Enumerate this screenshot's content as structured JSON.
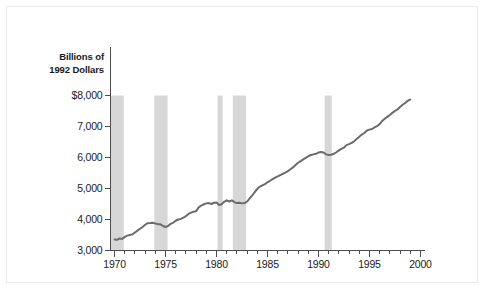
{
  "chart_data": {
    "type": "line",
    "title": "Billions of 1992 Dollars",
    "title_lines": [
      "Billions of",
      "1992 Dollars"
    ],
    "xlabel": "",
    "ylabel": "Billions of 1992 Dollars",
    "xlim": [
      1969.6,
      2000.4
    ],
    "ylim": [
      3000,
      8000
    ],
    "grid": false,
    "legend": null,
    "y_ticks": [
      3000,
      4000,
      5000,
      6000,
      7000,
      8000
    ],
    "y_tick_labels": [
      "3,000",
      "4,000",
      "5,000",
      "6,000",
      "7,000",
      "$8,000"
    ],
    "y_tick_labels_ordered_top_down": [
      "$8,000",
      "$7,000",
      "6,000",
      "5,000",
      "4,000",
      "3,000"
    ],
    "x_ticks": [
      1970,
      1975,
      1980,
      1985,
      1990,
      1995,
      2000
    ],
    "x_tick_labels": [
      "1970",
      "1975",
      "1980",
      "1985",
      "1990",
      "1995",
      "2000"
    ],
    "x_minor_tick_interval": 1,
    "line_color": "#6b6b6b",
    "line_width": 2,
    "band_color": "#d7d7d7",
    "axis_color": "#4d4d4d",
    "recession_bands": [
      {
        "start": 1969.6,
        "end": 1970.9
      },
      {
        "start": 1973.9,
        "end": 1975.2
      },
      {
        "start": 1980.1,
        "end": 1980.6
      },
      {
        "start": 1981.6,
        "end": 1982.9
      },
      {
        "start": 1990.6,
        "end": 1991.3
      }
    ],
    "series": [
      {
        "name": "Real GDP",
        "x": [
          1970.0,
          1970.25,
          1970.5,
          1970.75,
          1971.0,
          1971.25,
          1971.5,
          1971.75,
          1972.0,
          1972.25,
          1972.5,
          1972.75,
          1973.0,
          1973.25,
          1973.5,
          1973.75,
          1974.0,
          1974.25,
          1974.5,
          1974.75,
          1975.0,
          1975.25,
          1975.5,
          1975.75,
          1976.0,
          1976.25,
          1976.5,
          1976.75,
          1977.0,
          1977.25,
          1977.5,
          1977.75,
          1978.0,
          1978.25,
          1978.5,
          1978.75,
          1979.0,
          1979.25,
          1979.5,
          1979.75,
          1980.0,
          1980.25,
          1980.5,
          1980.75,
          1981.0,
          1981.25,
          1981.5,
          1981.75,
          1982.0,
          1982.25,
          1982.5,
          1982.75,
          1983.0,
          1983.25,
          1983.5,
          1983.75,
          1984.0,
          1984.25,
          1984.5,
          1984.75,
          1985.0,
          1985.25,
          1985.5,
          1985.75,
          1986.0,
          1986.25,
          1986.5,
          1986.75,
          1987.0,
          1987.25,
          1987.5,
          1987.75,
          1988.0,
          1988.25,
          1988.5,
          1988.75,
          1989.0,
          1989.25,
          1989.5,
          1989.75,
          1990.0,
          1990.25,
          1990.5,
          1990.75,
          1991.0,
          1991.25,
          1991.5,
          1991.75,
          1992.0,
          1992.25,
          1992.5,
          1992.75,
          1993.0,
          1993.25,
          1993.5,
          1993.75,
          1994.0,
          1994.25,
          1994.5,
          1994.75,
          1995.0,
          1995.25,
          1995.5,
          1995.75,
          1996.0,
          1996.25,
          1996.5,
          1996.75,
          1997.0,
          1997.25,
          1997.5,
          1997.75,
          1998.0,
          1998.25,
          1998.5,
          1998.75,
          1999.0
        ],
        "values": [
          3355,
          3345,
          3390,
          3375,
          3440,
          3480,
          3500,
          3520,
          3580,
          3640,
          3700,
          3760,
          3830,
          3880,
          3885,
          3895,
          3870,
          3850,
          3845,
          3790,
          3760,
          3790,
          3860,
          3900,
          3960,
          4000,
          4020,
          4060,
          4110,
          4180,
          4220,
          4250,
          4270,
          4390,
          4450,
          4490,
          4520,
          4530,
          4500,
          4540,
          4550,
          4470,
          4490,
          4570,
          4620,
          4580,
          4620,
          4560,
          4530,
          4540,
          4520,
          4530,
          4580,
          4680,
          4780,
          4880,
          4990,
          5060,
          5100,
          5140,
          5200,
          5250,
          5300,
          5350,
          5390,
          5430,
          5470,
          5510,
          5560,
          5620,
          5680,
          5760,
          5830,
          5880,
          5940,
          5990,
          6040,
          6080,
          6100,
          6120,
          6160,
          6180,
          6160,
          6100,
          6080,
          6090,
          6120,
          6170,
          6230,
          6280,
          6320,
          6400,
          6430,
          6470,
          6520,
          6600,
          6670,
          6740,
          6790,
          6870,
          6900,
          6920,
          6970,
          7010,
          7080,
          7180,
          7250,
          7310,
          7370,
          7440,
          7500,
          7550,
          7630,
          7700,
          7760,
          7830,
          7870
        ]
      }
    ]
  },
  "figure": {
    "background_color": "#ffffff",
    "border_color": "#e9e9e9"
  }
}
